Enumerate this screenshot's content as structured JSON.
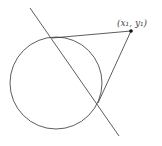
{
  "diagram": {
    "type": "geometry",
    "point_label": "(x₁, y₁)",
    "circle": {
      "cx": 56,
      "cy": 83,
      "r": 46
    },
    "external_point": {
      "x": 131,
      "y": 31
    },
    "tangent_points": [
      {
        "x": 52,
        "y": 38
      },
      {
        "x": 98,
        "y": 103
      }
    ],
    "chord_line": {
      "x1": 30,
      "y1": 8,
      "x2": 119,
      "y2": 136
    },
    "stroke_color": "#333333"
  }
}
